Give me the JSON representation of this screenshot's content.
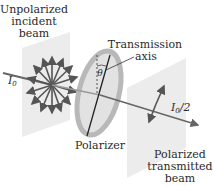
{
  "diagram": {
    "labels": {
      "incident_line1": "Unpolarized",
      "incident_line2": "incident",
      "incident_line3": "beam",
      "intensity_in": "I",
      "intensity_in_sub": "0",
      "axis_line1": "Transmission",
      "axis_line2": "axis",
      "angle": "θ",
      "polarizer": "Polarizer",
      "intensity_out": "I",
      "intensity_out_sub": "0",
      "intensity_out_suffix": "/2",
      "transmitted_line1": "Polarized",
      "transmitted_line2": "transmitted",
      "transmitted_line3": "beam"
    },
    "colors": {
      "plane": "#ececec",
      "polarizer_ring": "#b8b8b8",
      "polarizer_fill": "#e2e2e2",
      "arrow": "#555555",
      "beam": "#666666",
      "text": "#2a2a2a"
    }
  }
}
